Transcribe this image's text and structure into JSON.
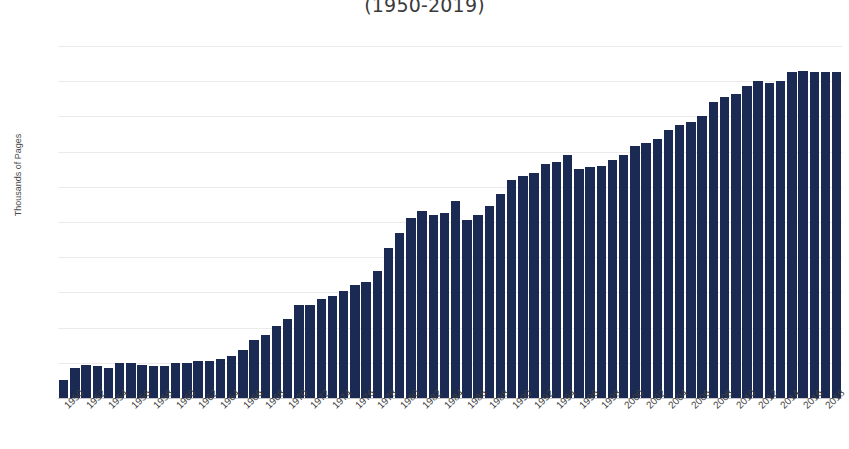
{
  "chart_data": {
    "type": "bar",
    "title": "(1950-2019)",
    "xlabel": "",
    "ylabel": "Thousands of Pages",
    "ylim": [
      0,
      200
    ],
    "ytick_step": 20,
    "yticks": [
      200,
      180,
      160,
      140,
      120,
      100,
      80,
      60,
      40,
      20,
      0
    ],
    "grid": true,
    "legend": "none",
    "bar_color": "#1b2a52",
    "grid_color": "#eceaea",
    "axis_color": "#c9c7c7",
    "text_color": "#4f4f4f",
    "xtick_labels": [
      "1950",
      "1952",
      "1954",
      "1956",
      "1958",
      "1960",
      "1962",
      "1964",
      "1966",
      "1968",
      "1970",
      "1972",
      "1974",
      "1976",
      "1978",
      "1980",
      "1982",
      "1984",
      "1986",
      "1988",
      "1990",
      "1992",
      "1994",
      "1996",
      "1998",
      "2000",
      "2002",
      "2004",
      "2006",
      "2008",
      "2010",
      "2012",
      "2014",
      "2016",
      "2018"
    ],
    "xtick_interval_years": 2,
    "categories": [
      "1950",
      "1951",
      "1952",
      "1953",
      "1954",
      "1955",
      "1956",
      "1957",
      "1958",
      "1959",
      "1960",
      "1961",
      "1962",
      "1963",
      "1964",
      "1965",
      "1966",
      "1967",
      "1968",
      "1969",
      "1970",
      "1971",
      "1972",
      "1973",
      "1974",
      "1975",
      "1976",
      "1977",
      "1978",
      "1979",
      "1980",
      "1981",
      "1982",
      "1983",
      "1984",
      "1985",
      "1986",
      "1987",
      "1988",
      "1989",
      "1990",
      "1991",
      "1992",
      "1993",
      "1994",
      "1995",
      "1996",
      "1997",
      "1998",
      "1999",
      "2000",
      "2001",
      "2002",
      "2003",
      "2004",
      "2005",
      "2006",
      "2007",
      "2008",
      "2009",
      "2010",
      "2011",
      "2012",
      "2013",
      "2014",
      "2015",
      "2016",
      "2017",
      "2018",
      "2019"
    ],
    "values": [
      10,
      17,
      19,
      18,
      17,
      20,
      20,
      19,
      18,
      18,
      20,
      20,
      21,
      21,
      22,
      24,
      27,
      33,
      36,
      41,
      45,
      53,
      53,
      56,
      58,
      61,
      64,
      66,
      72,
      85,
      94,
      102,
      106,
      104,
      105,
      112,
      101,
      104,
      109,
      116,
      124,
      126,
      128,
      133,
      134,
      138,
      130,
      131,
      132,
      135,
      138,
      143,
      145,
      147,
      152,
      155,
      157,
      160,
      168,
      171,
      173,
      177,
      180,
      179,
      180,
      185,
      186,
      185,
      185,
      185
    ]
  }
}
